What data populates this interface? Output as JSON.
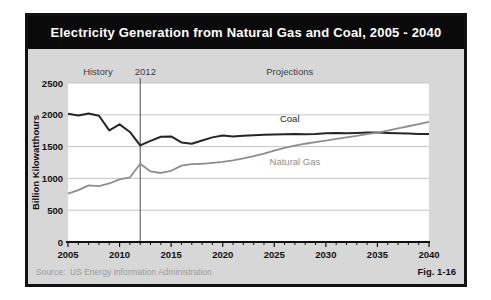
{
  "figure": {
    "title": "Electricity Generation from Natural Gas and Coal, 2005 - 2040",
    "source_label": "Source:",
    "source_text": "US Energy Information Administration",
    "fig_label": "Fig. 1-16"
  },
  "colors": {
    "title_bar_bg": "#0a0a0a",
    "title_text": "#ffffff",
    "panel_bg": "#d7d7d7",
    "border": "#111111"
  },
  "chart_data": {
    "type": "line",
    "title": "Electricity Generation from Natural Gas and Coal, 2005 - 2040",
    "xlabel": "",
    "ylabel": "Billion Kilowatthours",
    "xlim": [
      2005,
      2040
    ],
    "ylim": [
      0,
      2500
    ],
    "x_ticks": [
      2005,
      2010,
      2015,
      2020,
      2025,
      2030,
      2035,
      2040
    ],
    "y_ticks": [
      0,
      500,
      1000,
      1500,
      2000,
      2500
    ],
    "grid": "horizontal",
    "legend_position": "inline-labels",
    "divider_year": 2012,
    "colors": {
      "plot_bg": "#ffffff",
      "grid": "#c6c6c6",
      "divider": "#4a4a4a",
      "axis": "#111111"
    },
    "x": [
      2005,
      2006,
      2007,
      2008,
      2009,
      2010,
      2011,
      2012,
      2013,
      2014,
      2015,
      2016,
      2017,
      2018,
      2019,
      2020,
      2021,
      2022,
      2023,
      2024,
      2025,
      2026,
      2027,
      2028,
      2029,
      2030,
      2031,
      2032,
      2033,
      2034,
      2035,
      2036,
      2037,
      2038,
      2039,
      2040
    ],
    "series": [
      {
        "name": "Coal",
        "color": "#262626",
        "width": 2,
        "values": [
          2015,
          1990,
          2020,
          1985,
          1755,
          1850,
          1730,
          1520,
          1590,
          1655,
          1660,
          1565,
          1545,
          1595,
          1645,
          1675,
          1660,
          1670,
          1680,
          1685,
          1690,
          1695,
          1700,
          1695,
          1700,
          1710,
          1715,
          1710,
          1715,
          1720,
          1720,
          1715,
          1710,
          1705,
          1700,
          1700
        ]
      },
      {
        "name": "Natural Gas",
        "color": "#8e8e8e",
        "width": 1.8,
        "values": [
          760,
          815,
          890,
          880,
          920,
          985,
          1015,
          1230,
          1110,
          1085,
          1120,
          1200,
          1225,
          1230,
          1245,
          1260,
          1285,
          1315,
          1350,
          1390,
          1435,
          1480,
          1515,
          1545,
          1570,
          1595,
          1620,
          1645,
          1670,
          1695,
          1720,
          1750,
          1785,
          1820,
          1855,
          1890
        ]
      }
    ],
    "annotations": [
      {
        "label": "History",
        "year": 2007.9,
        "row": "top",
        "color": "#3c3c3c"
      },
      {
        "label": "2012",
        "year": 2012.5,
        "row": "top",
        "color": "#3c3c3c"
      },
      {
        "label": "Projections",
        "year": 2026.5,
        "row": "top",
        "color": "#3c3c3c"
      },
      {
        "label": "Coal",
        "year": 2026.5,
        "value": 1890,
        "color": "#1e1e1e"
      },
      {
        "label": "Natural Gas",
        "year": 2027.0,
        "value": 1205,
        "color": "#8e8e8e"
      }
    ]
  }
}
